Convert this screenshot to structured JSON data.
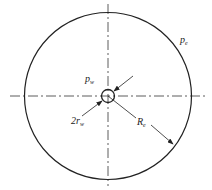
{
  "diagram": {
    "labels": {
      "outer_pressure": {
        "main": "p",
        "sub": "e"
      },
      "well_pressure": {
        "main": "p",
        "sub": "w"
      },
      "well_diameter": {
        "main": "2r",
        "sub": "w"
      },
      "outer_radius": {
        "main": "R",
        "sub": "e"
      }
    },
    "colors": {
      "line": "#222222",
      "background": "#ffffff"
    }
  }
}
